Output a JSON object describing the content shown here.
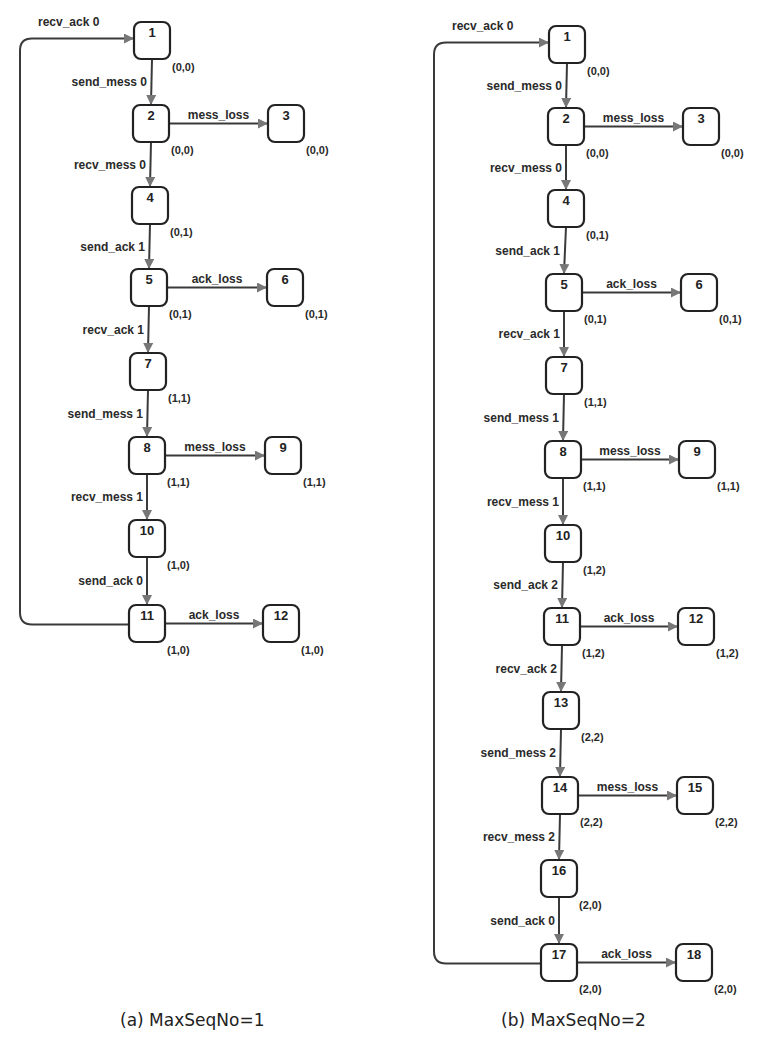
{
  "diagrams": [
    {
      "caption": "(a) MaxSeqNo=1",
      "nodes": [
        {
          "id": "1",
          "state": "(0,0)",
          "x": 134,
          "y": 22
        },
        {
          "id": "2",
          "state": "(0,0)",
          "x": 133,
          "y": 105
        },
        {
          "id": "3",
          "state": "(0,0)",
          "x": 268,
          "y": 105
        },
        {
          "id": "4",
          "state": "(0,1)",
          "x": 132,
          "y": 187
        },
        {
          "id": "5",
          "state": "(0,1)",
          "x": 131,
          "y": 269
        },
        {
          "id": "6",
          "state": "(0,1)",
          "x": 267,
          "y": 269
        },
        {
          "id": "7",
          "state": "(1,1)",
          "x": 130,
          "y": 353
        },
        {
          "id": "8",
          "state": "(1,1)",
          "x": 129,
          "y": 437
        },
        {
          "id": "9",
          "state": "(1,1)",
          "x": 265,
          "y": 437
        },
        {
          "id": "10",
          "state": "(1,0)",
          "x": 129,
          "y": 520
        },
        {
          "id": "11",
          "state": "(1,0)",
          "x": 129,
          "y": 605
        },
        {
          "id": "12",
          "state": "(1,0)",
          "x": 263,
          "y": 605
        }
      ],
      "edges": [
        {
          "from": "1",
          "to": "2",
          "label": "send_mess 0"
        },
        {
          "from": "2",
          "to": "3",
          "label": "mess_loss"
        },
        {
          "from": "2",
          "to": "4",
          "label": "recv_mess 0"
        },
        {
          "from": "4",
          "to": "5",
          "label": "send_ack 1"
        },
        {
          "from": "5",
          "to": "6",
          "label": "ack_loss"
        },
        {
          "from": "5",
          "to": "7",
          "label": "recv_ack 1"
        },
        {
          "from": "7",
          "to": "8",
          "label": "send_mess 1"
        },
        {
          "from": "8",
          "to": "9",
          "label": "mess_loss"
        },
        {
          "from": "8",
          "to": "10",
          "label": "recv_mess 1"
        },
        {
          "from": "10",
          "to": "11",
          "label": "send_ack 0"
        },
        {
          "from": "11",
          "to": "12",
          "label": "ack_loss"
        },
        {
          "from": "11",
          "to": "1",
          "label": "recv_ack 0",
          "loop": true
        }
      ],
      "loop_x": 20
    },
    {
      "caption": "(b) MaxSeqNo=2",
      "nodes": [
        {
          "id": "1",
          "state": "(0,0)",
          "x": 549,
          "y": 26
        },
        {
          "id": "2",
          "state": "(0,0)",
          "x": 548,
          "y": 108
        },
        {
          "id": "3",
          "state": "(0,0)",
          "x": 683,
          "y": 108
        },
        {
          "id": "4",
          "state": "(0,1)",
          "x": 548,
          "y": 190
        },
        {
          "id": "5",
          "state": "(0,1)",
          "x": 546,
          "y": 274
        },
        {
          "id": "6",
          "state": "(0,1)",
          "x": 681,
          "y": 274
        },
        {
          "id": "7",
          "state": "(1,1)",
          "x": 546,
          "y": 357
        },
        {
          "id": "8",
          "state": "(1,1)",
          "x": 545,
          "y": 441
        },
        {
          "id": "9",
          "state": "(1,1)",
          "x": 679,
          "y": 441
        },
        {
          "id": "10",
          "state": "(1,2)",
          "x": 545,
          "y": 525
        },
        {
          "id": "11",
          "state": "(1,2)",
          "x": 544,
          "y": 608
        },
        {
          "id": "12",
          "state": "(1,2)",
          "x": 678,
          "y": 608
        },
        {
          "id": "13",
          "state": "(2,2)",
          "x": 543,
          "y": 692
        },
        {
          "id": "14",
          "state": "(2,2)",
          "x": 542,
          "y": 777
        },
        {
          "id": "15",
          "state": "(2,2)",
          "x": 677,
          "y": 777
        },
        {
          "id": "16",
          "state": "(2,0)",
          "x": 541,
          "y": 860
        },
        {
          "id": "17",
          "state": "(2,0)",
          "x": 541,
          "y": 944
        },
        {
          "id": "18",
          "state": "(2,0)",
          "x": 676,
          "y": 944
        }
      ],
      "edges": [
        {
          "from": "1",
          "to": "2",
          "label": "send_mess 0"
        },
        {
          "from": "2",
          "to": "3",
          "label": "mess_loss"
        },
        {
          "from": "2",
          "to": "4",
          "label": "recv_mess 0"
        },
        {
          "from": "4",
          "to": "5",
          "label": "send_ack 1"
        },
        {
          "from": "5",
          "to": "6",
          "label": "ack_loss"
        },
        {
          "from": "5",
          "to": "7",
          "label": "recv_ack 1"
        },
        {
          "from": "7",
          "to": "8",
          "label": "send_mess 1"
        },
        {
          "from": "8",
          "to": "9",
          "label": "mess_loss"
        },
        {
          "from": "8",
          "to": "10",
          "label": "recv_mess 1"
        },
        {
          "from": "10",
          "to": "11",
          "label": "send_ack 2"
        },
        {
          "from": "11",
          "to": "12",
          "label": "ack_loss"
        },
        {
          "from": "11",
          "to": "13",
          "label": "recv_ack 2"
        },
        {
          "from": "13",
          "to": "14",
          "label": "send_mess 2"
        },
        {
          "from": "14",
          "to": "15",
          "label": "mess_loss"
        },
        {
          "from": "14",
          "to": "16",
          "label": "recv_mess 2"
        },
        {
          "from": "16",
          "to": "17",
          "label": "send_ack 0"
        },
        {
          "from": "17",
          "to": "18",
          "label": "ack_loss"
        },
        {
          "from": "17",
          "to": "1",
          "label": "recv_ack 0",
          "loop": true
        }
      ],
      "loop_x": 434
    }
  ],
  "style": {
    "node_w": 36,
    "node_h": 37,
    "edge_color": "#3a3a3a",
    "arrow_color": "#777777"
  }
}
